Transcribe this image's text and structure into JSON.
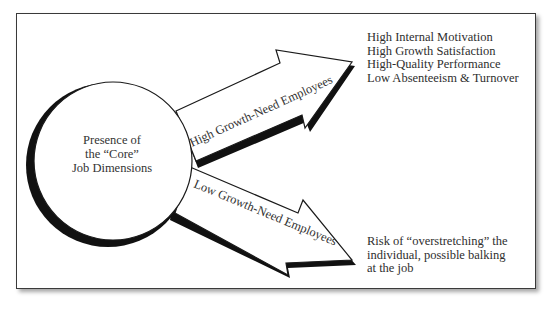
{
  "diagram": {
    "center": {
      "lines": [
        "Presence of",
        "the “Core”",
        "Job Dimensions"
      ]
    },
    "arrows": [
      {
        "label": "High Growth-Need Employees",
        "outcomes": [
          "High Internal Motivation",
          "High Growth Satisfaction",
          "High-Quality Performance",
          "Low Absenteeism & Turnover"
        ]
      },
      {
        "label": "Low Growth-Need Employees",
        "outcomes": [
          "Risk of “overstretching” the",
          "individual, possible balking",
          "at the job"
        ]
      }
    ],
    "colors": {
      "stroke": "#1a1a1a",
      "shadow": "#111111",
      "fill": "#ffffff",
      "text": "#2e2e2e"
    }
  }
}
